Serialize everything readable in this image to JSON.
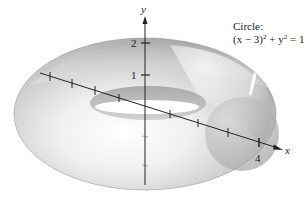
{
  "figure": {
    "annotation": {
      "line1": "Circle:",
      "equation": {
        "lhs_a": "(x − 3)",
        "exp_a": "2",
        "plus": " + y",
        "exp_b": "2",
        "rhs": " = 1"
      }
    },
    "axes": {
      "y_label": "y",
      "x_label": "x",
      "y_ticks": [
        "1",
        "2"
      ],
      "x_tick_label": "4"
    },
    "circle": {
      "center_x": 3,
      "center_y": 0,
      "radius": 1
    },
    "colors": {
      "surface_light": "#f4f4f4",
      "surface_mid": "#c8c8c8",
      "surface_dark": "#8f8f8f",
      "axis": "#222222",
      "background": "#ffffff"
    }
  }
}
